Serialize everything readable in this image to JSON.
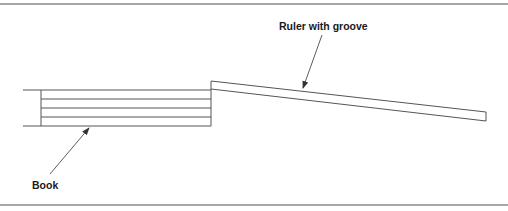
{
  "figure": {
    "type": "diagram",
    "colors": {
      "line": "#555555",
      "frame": "#8a8a8a",
      "text": "#1a1a1a",
      "background": "#ffffff"
    }
  },
  "labels": {
    "ruler": "Ruler with groove",
    "book": "Book"
  },
  "geometry": {
    "frame": {
      "top_y": 4,
      "bottom_y": 205
    },
    "book": {
      "left_x": 41,
      "right_x": 211,
      "ledge_start_x": 23,
      "page_lines_y": [
        90,
        99,
        108,
        117,
        126
      ]
    },
    "ruler": {
      "top_start": [
        211,
        81
      ],
      "bottom_start": [
        211,
        89
      ],
      "top_end": [
        486,
        112
      ],
      "bottom_end": [
        486,
        121
      ]
    },
    "arrows": {
      "ruler": {
        "from": [
          322,
          35
        ],
        "to": [
          303,
          88
        ]
      },
      "book": {
        "from": [
          50,
          174
        ],
        "to": [
          89,
          128
        ]
      }
    }
  }
}
